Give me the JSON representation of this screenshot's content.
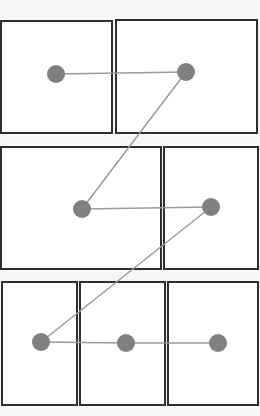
{
  "diagram": {
    "canvas": {
      "width": 260,
      "height": 416,
      "background": "#f6f6f6"
    },
    "style": {
      "box_fill": "#ffffff",
      "box_stroke": "#2e2e2e",
      "box_stroke_width": 2,
      "node_fill": "#808080",
      "node_radius": 9,
      "edge_stroke": "#9a9a9a",
      "edge_stroke_width": 1.5
    },
    "boxes": [
      {
        "id": "box-1",
        "row": 1,
        "x": 1,
        "y": 21,
        "w": 111,
        "h": 112
      },
      {
        "id": "box-2",
        "row": 1,
        "x": 116,
        "y": 20,
        "w": 141,
        "h": 113
      },
      {
        "id": "box-3",
        "row": 2,
        "x": 1,
        "y": 147,
        "w": 160,
        "h": 122
      },
      {
        "id": "box-4",
        "row": 2,
        "x": 164,
        "y": 147,
        "w": 94,
        "h": 122
      },
      {
        "id": "box-5",
        "row": 3,
        "x": 2,
        "y": 282,
        "w": 75,
        "h": 123
      },
      {
        "id": "box-6",
        "row": 3,
        "x": 80,
        "y": 282,
        "w": 85,
        "h": 123
      },
      {
        "id": "box-7",
        "row": 3,
        "x": 168,
        "y": 282,
        "w": 90,
        "h": 123
      }
    ],
    "nodes": [
      {
        "id": "node-1",
        "box": "box-1",
        "cx": 56,
        "cy": 74
      },
      {
        "id": "node-2",
        "box": "box-2",
        "cx": 186,
        "cy": 72
      },
      {
        "id": "node-3",
        "box": "box-3",
        "cx": 82,
        "cy": 209
      },
      {
        "id": "node-4",
        "box": "box-4",
        "cx": 211,
        "cy": 207
      },
      {
        "id": "node-5",
        "box": "box-5",
        "cx": 41,
        "cy": 342
      },
      {
        "id": "node-6",
        "box": "box-6",
        "cx": 126,
        "cy": 343
      },
      {
        "id": "node-7",
        "box": "box-7",
        "cx": 218,
        "cy": 343
      }
    ],
    "edges": [
      {
        "from": "node-1",
        "to": "node-2"
      },
      {
        "from": "node-2",
        "to": "node-3"
      },
      {
        "from": "node-3",
        "to": "node-4"
      },
      {
        "from": "node-4",
        "to": "node-5"
      },
      {
        "from": "node-5",
        "to": "node-6"
      },
      {
        "from": "node-6",
        "to": "node-7"
      }
    ]
  }
}
